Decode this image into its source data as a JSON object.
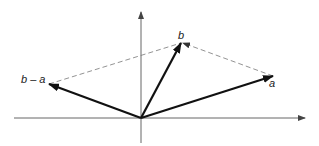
{
  "diagram": {
    "type": "vector-subtraction",
    "labels": {
      "a": "a",
      "b": "b",
      "b_minus_a": "b – a"
    },
    "colors": {
      "axis": "#555555",
      "vector": "#111111",
      "dashed": "#777777",
      "text": "#222222"
    },
    "points": {
      "origin": [
        141,
        118
      ],
      "a_tip": [
        273,
        76
      ],
      "b_tip": [
        181,
        43
      ],
      "b_minus_a_tip": [
        49,
        84
      ]
    }
  }
}
